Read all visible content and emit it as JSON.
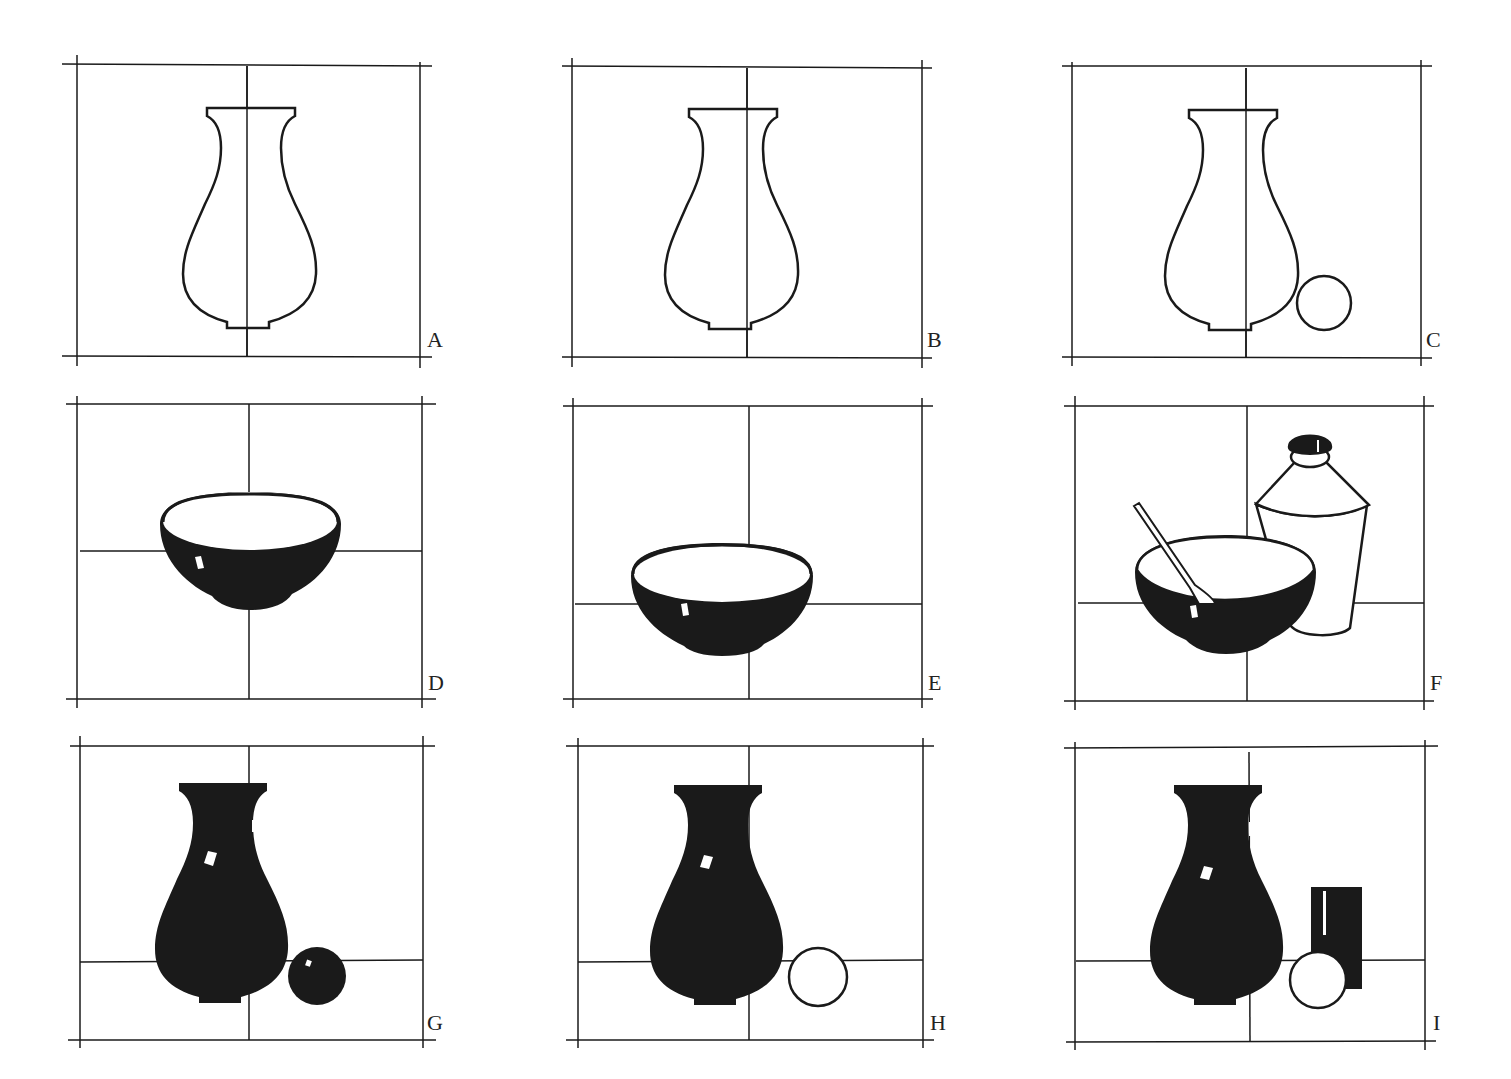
{
  "figure": {
    "colors": {
      "ink": "#1a1a1a",
      "paper": "#ffffff"
    },
    "panels": [
      {
        "label": "A",
        "content": "outline vase centered on vertical midline"
      },
      {
        "label": "B",
        "content": "outline vase offset right of midline"
      },
      {
        "label": "C",
        "content": "outline vase with small outline circle"
      },
      {
        "label": "D",
        "content": "dark bowl centered on crosshair"
      },
      {
        "label": "E",
        "content": "dark bowl lowered below center"
      },
      {
        "label": "F",
        "content": "dark bowl with spoon and outline bottle"
      },
      {
        "label": "G",
        "content": "solid black vase with black sphere"
      },
      {
        "label": "H",
        "content": "solid black vase with white circle"
      },
      {
        "label": "I",
        "content": "solid black vase with white circle and black block"
      }
    ]
  }
}
